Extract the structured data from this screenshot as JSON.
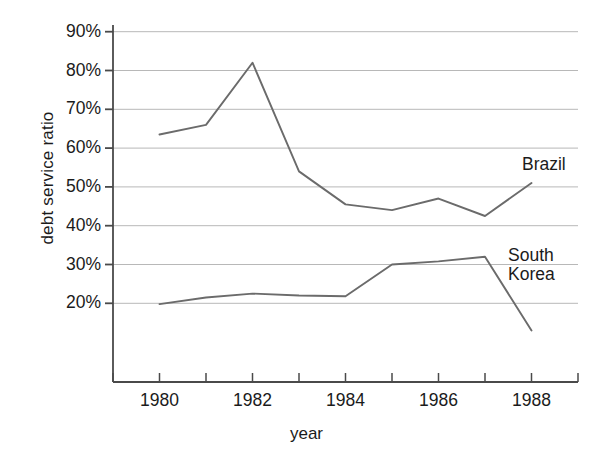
{
  "chart_data": {
    "type": "line",
    "title": "",
    "xlabel": "year",
    "ylabel": "debt service ratio",
    "x": [
      1980,
      1981,
      1982,
      1983,
      1984,
      1985,
      1986,
      1987,
      1988
    ],
    "xlim": [
      1979,
      1989
    ],
    "ylim": [
      15,
      90
    ],
    "grid": true,
    "gridlines_y": [
      20,
      30,
      40,
      50,
      60,
      70,
      80,
      90
    ],
    "x_tick_values": [
      1979,
      1980,
      1981,
      1982,
      1983,
      1984,
      1985,
      1986,
      1987,
      1988,
      1989
    ],
    "x_tick_labels": [
      "1980",
      "1982",
      "1984",
      "1986",
      "1988"
    ],
    "x_tick_label_values": [
      1980,
      1982,
      1984,
      1986,
      1988
    ],
    "y_tick_labels": [
      "20%",
      "30%",
      "40%",
      "50%",
      "60%",
      "70%",
      "80%",
      "90%"
    ],
    "y_tick_values": [
      20,
      30,
      40,
      50,
      60,
      70,
      80,
      90
    ],
    "legend_position": "inline-right-end-of-line",
    "line_color": "#6b6b6b",
    "axis_color": "#4a4a4a",
    "grid_color": "#b8b8b8",
    "series": [
      {
        "name": "Brazil",
        "label_lines": "Brazil",
        "values": [
          63.5,
          66.0,
          82.0,
          54.0,
          45.5,
          44.0,
          47.0,
          42.5,
          51.0
        ]
      },
      {
        "name": "South Korea",
        "label_lines": "South\nKorea",
        "values": [
          19.8,
          21.5,
          22.5,
          22.0,
          21.8,
          30.0,
          30.8,
          32.0,
          13.0
        ]
      }
    ]
  },
  "axes": {
    "ylabel": "debt service ratio",
    "xlabel": "year"
  }
}
